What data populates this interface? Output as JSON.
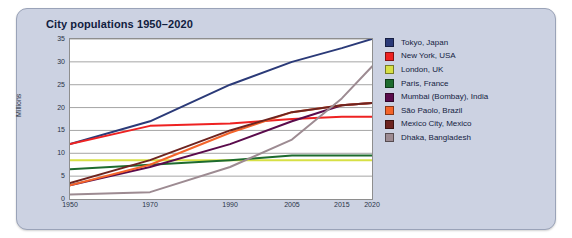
{
  "panel": {
    "background": "#ccd2e2"
  },
  "chart_data": {
    "type": "line",
    "title": "City populations 1950–2020",
    "xlabel": "",
    "ylabel": "Millions",
    "x": [
      1950,
      1970,
      1990,
      2005,
      2015,
      2020
    ],
    "xtick_labels": [
      "1950",
      "1970",
      "1990",
      "2005",
      "2015",
      "2020"
    ],
    "ytick_labels": [
      "0",
      "5",
      "10",
      "15",
      "20",
      "25",
      "30",
      "35"
    ],
    "yticks": [
      0,
      5,
      10,
      15,
      20,
      25,
      30,
      35
    ],
    "ylim": [
      0,
      35
    ],
    "grid": "horizontal",
    "legend_position": "right",
    "series": [
      {
        "name": "Tokyo, Japan",
        "color": "#2b3a78",
        "values": [
          12.0,
          17.0,
          25.0,
          30.0,
          33.0,
          35.0
        ]
      },
      {
        "name": "New York, USA",
        "color": "#ee2222",
        "values": [
          12.0,
          16.0,
          16.5,
          17.5,
          18.0,
          18.0
        ]
      },
      {
        "name": "London, UK",
        "color": "#d7e045",
        "values": [
          8.5,
          8.5,
          8.5,
          8.5,
          8.5,
          8.5
        ]
      },
      {
        "name": "Paris, France",
        "color": "#1d6b2e",
        "values": [
          6.5,
          7.5,
          8.5,
          9.5,
          9.5,
          9.5
        ]
      },
      {
        "name": "Mumbai (Bombay), India",
        "color": "#5a0b4c",
        "values": [
          3.0,
          7.0,
          12.0,
          17.0,
          20.5,
          21.0
        ]
      },
      {
        "name": "São Paolo, Brazil",
        "color": "#f4642a",
        "values": [
          3.0,
          7.5,
          14.5,
          19.0,
          20.5,
          21.0
        ]
      },
      {
        "name": "Mexico City, Mexico",
        "color": "#6d2420",
        "values": [
          3.5,
          8.5,
          15.0,
          19.0,
          20.5,
          21.0
        ]
      },
      {
        "name": "Dhaka, Bangladesh",
        "color": "#9d8b92",
        "values": [
          1.0,
          1.5,
          7.0,
          13.0,
          22.0,
          29.0
        ]
      }
    ]
  }
}
